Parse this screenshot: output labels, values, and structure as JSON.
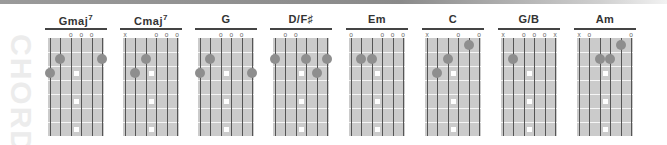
{
  "side_label": "CHORDS",
  "colors": {
    "board": "#cbcbcb",
    "finger_dot": "#8e8e8e",
    "fret_line": "#f5f5f5",
    "string_line": "#555555",
    "title_text": "#333333",
    "side_label": "#ececec"
  },
  "fretboard": {
    "strings": 6,
    "frets": 7,
    "inlay_frets": [
      3,
      5,
      7
    ]
  },
  "chords": [
    {
      "name": "Gmaj",
      "sup": "7",
      "left": 45,
      "top_markers": [
        "",
        "",
        "o",
        "o",
        "o",
        ""
      ],
      "fingers": [
        {
          "string": 6,
          "fret": 3
        },
        {
          "string": 5,
          "fret": 2
        },
        {
          "string": 1,
          "fret": 2
        }
      ]
    },
    {
      "name": "Cmaj",
      "sup": "7",
      "left": 120,
      "top_markers": [
        "x",
        "",
        "",
        "o",
        "o",
        "o"
      ],
      "fingers": [
        {
          "string": 5,
          "fret": 3
        },
        {
          "string": 4,
          "fret": 2
        }
      ]
    },
    {
      "name": "G",
      "sup": "",
      "left": 195,
      "top_markers": [
        "",
        "",
        "o",
        "o",
        "o",
        ""
      ],
      "fingers": [
        {
          "string": 6,
          "fret": 3
        },
        {
          "string": 5,
          "fret": 2
        },
        {
          "string": 1,
          "fret": 3
        }
      ]
    },
    {
      "name": "D/F♯",
      "sup": "",
      "left": 270,
      "top_markers": [
        "",
        "o",
        "o",
        "",
        "",
        ""
      ],
      "fingers": [
        {
          "string": 6,
          "fret": 2
        },
        {
          "string": 3,
          "fret": 2
        },
        {
          "string": 2,
          "fret": 3
        },
        {
          "string": 1,
          "fret": 2
        }
      ]
    },
    {
      "name": "Em",
      "sup": "",
      "left": 346,
      "top_markers": [
        "o",
        "",
        "",
        "o",
        "o",
        "o"
      ],
      "fingers": [
        {
          "string": 5,
          "fret": 2
        },
        {
          "string": 4,
          "fret": 2
        }
      ]
    },
    {
      "name": "C",
      "sup": "",
      "left": 422,
      "top_markers": [
        "x",
        "",
        "",
        "o",
        "",
        "o"
      ],
      "fingers": [
        {
          "string": 5,
          "fret": 3
        },
        {
          "string": 4,
          "fret": 2
        },
        {
          "string": 2,
          "fret": 1
        }
      ]
    },
    {
      "name": "G/B",
      "sup": "",
      "left": 498,
      "top_markers": [
        "x",
        "",
        "o",
        "o",
        "o",
        "x"
      ],
      "fingers": [
        {
          "string": 5,
          "fret": 2
        }
      ]
    },
    {
      "name": "Am",
      "sup": "",
      "left": 574,
      "top_markers": [
        "x",
        "o",
        "",
        "",
        "",
        "o"
      ],
      "fingers": [
        {
          "string": 4,
          "fret": 2
        },
        {
          "string": 3,
          "fret": 2
        },
        {
          "string": 2,
          "fret": 1
        }
      ]
    }
  ]
}
